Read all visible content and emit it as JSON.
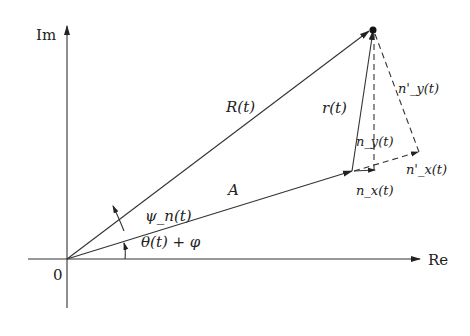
{
  "diagram": {
    "type": "phasor-diagram",
    "axes": {
      "x_label": "Re",
      "y_label": "Im",
      "origin_label": "0"
    },
    "vectors": {
      "R": "R(t)",
      "A": "A",
      "r": "r(t)",
      "nx": "n_x(t)",
      "ny": "n_y(t)",
      "nx_prime": "n'_x(t)",
      "ny_prime": "n'_y(t)"
    },
    "angles": {
      "psi": "ψ_n(t)",
      "theta": "θ(t) + φ"
    }
  }
}
